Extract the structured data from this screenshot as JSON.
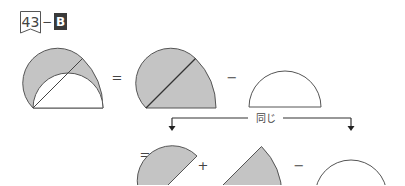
{
  "header": {
    "problem_number": "43",
    "separator": "−",
    "level": "B"
  },
  "equation_row1": {
    "equals": "=",
    "minus": "−"
  },
  "bracket": {
    "label": "同じ"
  },
  "equation_row2": {
    "equals": "=",
    "plus": "+",
    "minus": "−"
  },
  "colors": {
    "shade": "#c4c4c4",
    "stroke": "#555555",
    "badge_dark": "#3a3a3a"
  }
}
